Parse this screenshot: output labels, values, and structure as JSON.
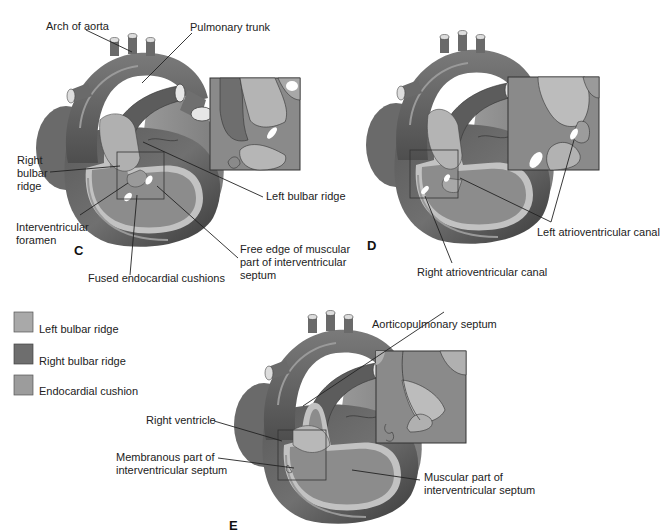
{
  "figure": {
    "panels": [
      {
        "id": "C",
        "letter": "C",
        "labels": {
          "arch_of_aorta": "Arch of aorta",
          "pulmonary_trunk": "Pulmonary trunk",
          "right_bulbar_ridge_1": "Right",
          "right_bulbar_ridge_2": "bulbar",
          "right_bulbar_ridge_3": "ridge",
          "left_bulbar_ridge": "Left bulbar ridge",
          "interventricular_foramen_1": "Interventricular",
          "interventricular_foramen_2": "foramen",
          "free_edge_1": "Free edge of muscular",
          "free_edge_2": "part of interventricular",
          "free_edge_3": "septum",
          "fused_cushions": "Fused endocardial cushions"
        }
      },
      {
        "id": "D",
        "letter": "D",
        "labels": {
          "left_av_canal": "Left atrioventricular canal",
          "right_av_canal": "Right atrioventricular canal"
        }
      },
      {
        "id": "E",
        "letter": "E",
        "labels": {
          "aorticopulmonary_septum": "Aorticopulmonary septum",
          "right_ventricle": "Right ventricle",
          "membranous_1": "Membranous part of",
          "membranous_2": "interventricular septum",
          "muscular_1": "Muscular part of",
          "muscular_2": "interventricular septum"
        }
      }
    ],
    "legend": [
      {
        "label": "Left bulbar ridge",
        "color": "#a9a9a9"
      },
      {
        "label": "Right bulbar ridge",
        "color": "#6e6e6e"
      },
      {
        "label": "Endocardial cushion",
        "color": "#9c9c9c"
      }
    ],
    "colors": {
      "heart_dark": "#4a4a4a",
      "heart_mid": "#7a7a7a",
      "heart_light": "#a8a8a8",
      "inner_band": "#c4c4c4",
      "cushion": "#b8b8b8"
    }
  }
}
